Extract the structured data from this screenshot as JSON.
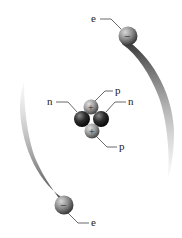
{
  "diagram": {
    "labels": {
      "electron_top": "e",
      "electron_bottom": "e",
      "proton_top": "p",
      "proton_bottom": "p",
      "neutron_left": "n",
      "neutron_right": "n"
    },
    "symbols": {
      "electron_charge": "−",
      "proton_charge": "+"
    },
    "colors": {
      "electron": "#8a8a8a",
      "proton": "#9a9a9a",
      "neutron": "#2e2e2e",
      "trail": "#333333",
      "leader_line": "#444444"
    }
  }
}
